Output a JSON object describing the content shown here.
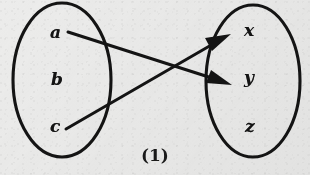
{
  "figure": {
    "caption": "(1)",
    "ink_color": "#141414",
    "paper_color": "#ececeb"
  },
  "domain_set": {
    "name": "left-set",
    "elements": [
      {
        "label": "a",
        "x": 50,
        "y": 24
      },
      {
        "label": "b",
        "x": 51,
        "y": 71
      },
      {
        "label": "c",
        "x": 50,
        "y": 118
      }
    ]
  },
  "codomain_set": {
    "name": "right-set",
    "elements": [
      {
        "label": "x",
        "x": 244,
        "y": 22
      },
      {
        "label": "y",
        "x": 244,
        "y": 69
      },
      {
        "label": "z",
        "x": 245,
        "y": 118
      }
    ]
  },
  "mappings": [
    {
      "from": "a",
      "to": "y",
      "name": "arrow-a-to-y"
    },
    {
      "from": "c",
      "to": "x",
      "name": "arrow-c-to-x"
    }
  ]
}
